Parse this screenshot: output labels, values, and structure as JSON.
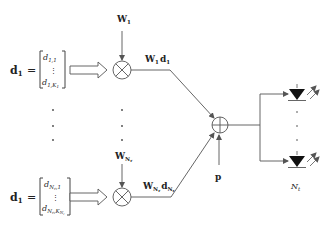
{
  "diagram": {
    "branch_top": {
      "vector_name": "d",
      "vector_sub": "1",
      "equals": "=",
      "entry_first": "d",
      "entry_first_sub": "1,1",
      "entry_dots": "⋮",
      "entry_last": "d",
      "entry_last_sub": "1,K",
      "entry_last_subsub": "1",
      "weight": "W",
      "weight_sub": "1",
      "product": "W",
      "product_sub": "1",
      "product_d": "d",
      "product_d_sub": "1"
    },
    "branch_bottom": {
      "vector_name": "d",
      "vector_sub": "1",
      "equals": "=",
      "entry_first": "d",
      "entry_first_sub": "N",
      "entry_first_subsub": "r",
      "entry_first_tail": ",1",
      "entry_dots": "⋮",
      "entry_last": "d",
      "entry_last_sub": "N",
      "entry_last_subsub": "r",
      "entry_last_mid": ",K",
      "entry_last_k_sub": "N",
      "entry_last_k_subsub": "r",
      "weight": "W",
      "weight_sub": "N",
      "weight_subsub": "r",
      "product": "W",
      "product_sub": "N",
      "product_subsub": "r",
      "product_d": "d",
      "product_d_sub": "N",
      "product_d_subsub": "r"
    },
    "vertical_dots": "·",
    "sum_node": "adder-circle",
    "bias_label": "p",
    "led_count_label": "N",
    "led_count_sub": "t",
    "colors": {
      "line": "#555555",
      "text": "#222222",
      "led_fill": "#111111"
    }
  }
}
